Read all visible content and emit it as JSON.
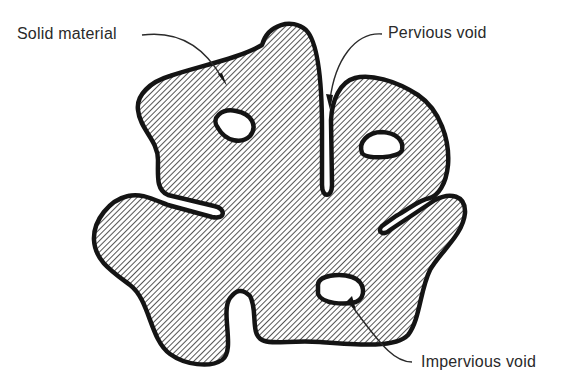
{
  "diagram": {
    "type": "soil particle cross-section",
    "colors": {
      "outline": "#141414",
      "hatch": "#2a2a2a",
      "void_fill": "#ffffff",
      "background": "#ffffff"
    },
    "labels": {
      "solid": "Solid material",
      "pervious": "Pervious void",
      "impervious": "Impervious void"
    }
  }
}
